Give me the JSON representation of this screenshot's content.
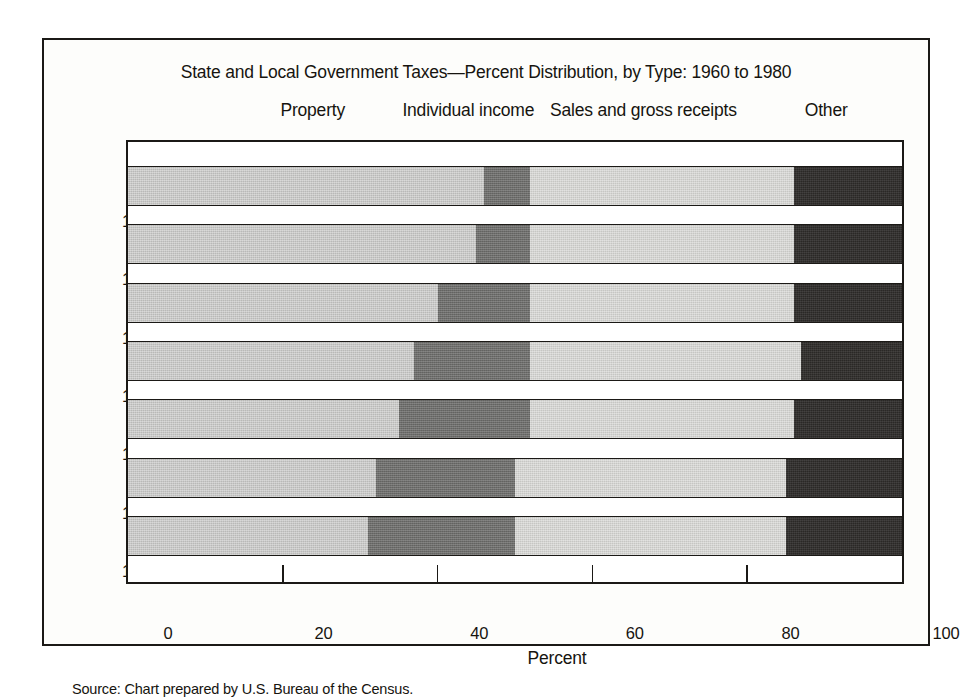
{
  "chart_data": {
    "type": "bar",
    "orientation": "horizontal",
    "stacked": true,
    "normalized": true,
    "title": "State and Local Government Taxes—Percent Distribution, by Type: 1960 to 1980",
    "xlabel": "Percent",
    "ylabel": "",
    "xlim": [
      0,
      100
    ],
    "xticks": [
      0,
      20,
      40,
      60,
      80,
      100
    ],
    "xtick_labels": [
      "0",
      "20",
      "40",
      "60",
      "80",
      "100"
    ],
    "grid": false,
    "legend_position": "top",
    "categories": [
      "1960",
      "1965",
      "1970",
      "1975",
      "1978",
      "1979",
      "1980"
    ],
    "series": [
      {
        "name": "Property",
        "values": [
          46,
          45,
          40,
          37,
          35,
          32,
          31
        ],
        "color": "#b9b9b7"
      },
      {
        "name": "Individual income",
        "values": [
          6,
          7,
          12,
          15,
          17,
          18,
          19
        ],
        "color": "#6e6e6c"
      },
      {
        "name": "Sales and gross receipts",
        "values": [
          34,
          34,
          34,
          35,
          34,
          35,
          35
        ],
        "color": "#c6c6c3"
      },
      {
        "name": "Other",
        "values": [
          14,
          14,
          14,
          13,
          14,
          15,
          15
        ],
        "color": "#2a2826"
      }
    ],
    "legend_label_positions_pct": [
      24,
      44,
      66.5,
      90
    ],
    "source": "Source: Chart prepared by U.S. Bureau of the Census."
  }
}
